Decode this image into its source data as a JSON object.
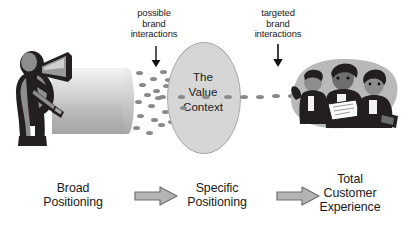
{
  "diagram": {
    "background_color": "#ffffff"
  },
  "annotations": [
    {
      "id": "possible-brand-interactions",
      "text": "possible\nbrand\ninteractions",
      "arrow": "down-arrow"
    },
    {
      "id": "targeted-brand-interactions",
      "text": "targeted\nbrand\ninteractions",
      "arrow": "down-arrow"
    }
  ],
  "center_node": {
    "name": "value-context-ellipse",
    "text": "The\nValue\nContext",
    "fill_color": "#d6d6d6",
    "stroke_color": "#a8a8a8"
  },
  "illustrations": [
    {
      "id": "megaphone-speaker",
      "alt": "person shouting through a megaphone"
    },
    {
      "id": "broadcast-cylinder",
      "alt": "gray gradient broadcast beam cylinder"
    },
    {
      "id": "business-audience",
      "alt": "group of three business people reviewing a document"
    }
  ],
  "dots": {
    "name": "brand-interaction-dots",
    "color": "#8a8a8a",
    "left_cluster_count": 22,
    "right_cluster_count": 5
  },
  "stages": [
    {
      "id": "broad-positioning",
      "text": "Broad\nPositioning"
    },
    {
      "id": "specific-positioning",
      "text": "Specific\nPositioning"
    },
    {
      "id": "total-customer-experience",
      "text": "Total\nCustomer\nExperience"
    }
  ],
  "flow_arrows": [
    {
      "id": "arrow-broad-to-specific",
      "fill_color": "#b4b4b4",
      "stroke_color": "#6e6e6e"
    },
    {
      "id": "arrow-specific-to-total",
      "fill_color": "#b4b4b4",
      "stroke_color": "#6e6e6e"
    }
  ],
  "colors": {
    "text": "#1a1a1a",
    "dot": "#8a8a8a",
    "ellipse_fill": "#d6d6d6",
    "arrow_fill": "#b4b4b4",
    "arrow_stroke": "#6e6e6e",
    "illustration_dark": "#231f20",
    "illustration_mid": "#8d8d8d",
    "illustration_light": "#c9c9c9"
  }
}
